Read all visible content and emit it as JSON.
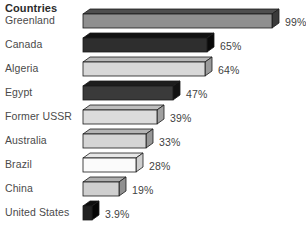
{
  "chart_data": {
    "type": "bar",
    "title": "Countries",
    "xlabel": "",
    "ylabel": "",
    "orientation": "horizontal",
    "grid": false,
    "legend": false,
    "style": "3d-bar",
    "unit": "%",
    "xlim": [
      0,
      99
    ],
    "categories": [
      "Greenland",
      "Canada",
      "Algeria",
      "Egypt",
      "Former USSR",
      "Australia",
      "Brazil",
      "China",
      "United States"
    ],
    "values": [
      99,
      65,
      64,
      47,
      39,
      33,
      28,
      19,
      3.9
    ],
    "value_labels": [
      "99%",
      "65%",
      "64%",
      "47%",
      "39%",
      "33%",
      "28%",
      "19%",
      "3.9%"
    ],
    "bar_colors": [
      "#8f8f8f",
      "#2e2e2e",
      "#d8d8d8",
      "#3a3a3a",
      "#dcdcdc",
      "#d5d5d5",
      "#fbfbfb",
      "#cfcfcf",
      "#222222"
    ],
    "bar_top_colors": [
      "#4e4e4e",
      "#111111",
      "#b7b7b7",
      "#1d1d1d",
      "#bdbdbd",
      "#b4b4b4",
      "#e7e7e7",
      "#aeaeae",
      "#0d0d0d"
    ],
    "bar_side_colors": [
      "#3a3a3a",
      "#0a0a0a",
      "#9a9a9a",
      "#121212",
      "#a0a0a0",
      "#979797",
      "#cfcfcf",
      "#909090",
      "#050505"
    ]
  },
  "title": {
    "text": "Countries"
  },
  "rows": [
    {
      "label": "Greenland",
      "value": "99%"
    },
    {
      "label": "Canada",
      "value": "65%"
    },
    {
      "label": "Algeria",
      "value": "64%"
    },
    {
      "label": "Egypt",
      "value": "47%"
    },
    {
      "label": "Former USSR",
      "value": "39%"
    },
    {
      "label": "Australia",
      "value": "33%"
    },
    {
      "label": "Brazil",
      "value": "28%"
    },
    {
      "label": "China",
      "value": "19%"
    },
    {
      "label": "United States",
      "value": "3.9%"
    }
  ],
  "colors": {
    "background": "#ffffff",
    "text": "#4a4a4a",
    "title": "#2b2b2b",
    "outline": "#1a1a1a"
  }
}
